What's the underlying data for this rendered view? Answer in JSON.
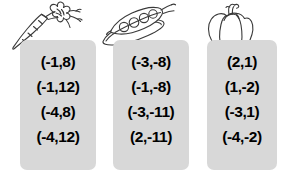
{
  "worksheet": {
    "columns": [
      {
        "icon": "carrot-icon",
        "icon_label": "carrot",
        "coordinates": [
          "(-1,8)",
          "(-1,12)",
          "(-4,8)",
          "(-4,12)"
        ]
      },
      {
        "icon": "pea-pod-icon",
        "icon_label": "pea pod",
        "coordinates": [
          "(-3,-8)",
          "(-1,-8)",
          "(-3,-11)",
          "(2,-11)"
        ]
      },
      {
        "icon": "bell-pepper-icon",
        "icon_label": "bell pepper",
        "coordinates": [
          "(2,1)",
          "(1,-2)",
          "(-3,1)",
          "(-4,-2)"
        ]
      }
    ]
  },
  "colors": {
    "card_background": "#d8d8d8",
    "text": "#000000",
    "page_background": "#ffffff",
    "line_art": "#3a3a3a"
  }
}
